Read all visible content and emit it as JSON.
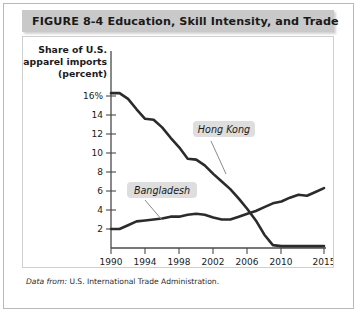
{
  "figure": {
    "number_label": "FIGURE  8-4",
    "title": "Education, Skill Intensity, and Trade",
    "full_title": "FIGURE  8-4   Education, Skill Intensity, and Trade",
    "source_lead": "Data from:",
    "source_text": "U.S. International Trade Administration.",
    "colors": {
      "title_bar": "#c9c9c9",
      "line": "#2b2b2b",
      "label_chip": "#dedede",
      "frame": "#b8b8b8",
      "card_border": "#cfcfcf"
    }
  },
  "chart_data": {
    "type": "line",
    "title": "Education, Skill Intensity, and Trade",
    "ylabel": "Share of U.S. apparel imports (percent)",
    "ylabel_lines": [
      "Share of U.S.",
      "apparel imports",
      "(percent)"
    ],
    "xlabel": "Year",
    "xlim": [
      1990,
      2015
    ],
    "ylim": [
      0,
      17
    ],
    "grid": false,
    "legend_position": "inline-annotations",
    "yticks": [
      2,
      4,
      6,
      8,
      10,
      12,
      14,
      16
    ],
    "ytick_labels": [
      "2",
      "4",
      "6",
      "8",
      "10",
      "12",
      "14",
      "16%"
    ],
    "xticks": [
      1990,
      1994,
      1998,
      2002,
      2006,
      2010,
      2015
    ],
    "xtick_labels": [
      "1990",
      "1994",
      "1998",
      "2002",
      "2006",
      "2010",
      "2015"
    ],
    "x": [
      1990,
      1991,
      1992,
      1993,
      1994,
      1995,
      1996,
      1997,
      1998,
      1999,
      2000,
      2001,
      2002,
      2003,
      2004,
      2005,
      2006,
      2007,
      2008,
      2009,
      2010,
      2011,
      2012,
      2013,
      2014,
      2015
    ],
    "series": [
      {
        "name": "Hong Kong",
        "label": "Hong Kong",
        "values": [
          16.3,
          16.3,
          15.7,
          14.6,
          13.6,
          13.5,
          12.7,
          11.6,
          10.6,
          9.4,
          9.3,
          8.7,
          7.8,
          7.0,
          6.2,
          5.2,
          4.1,
          2.9,
          1.4,
          0.3,
          0.2,
          0.2,
          0.2,
          0.2,
          0.2,
          0.2
        ]
      },
      {
        "name": "Bangladesh",
        "label": "Bangladesh",
        "values": [
          2.0,
          2.0,
          2.4,
          2.8,
          2.9,
          3.0,
          3.1,
          3.3,
          3.3,
          3.5,
          3.6,
          3.5,
          3.2,
          3.0,
          3.0,
          3.3,
          3.6,
          3.9,
          4.3,
          4.7,
          4.9,
          5.3,
          5.6,
          5.5,
          5.9,
          6.3
        ]
      }
    ],
    "annotations": [
      {
        "text": "Hong Kong",
        "for_series": "Hong Kong"
      },
      {
        "text": "Bangladesh",
        "for_series": "Bangladesh"
      }
    ]
  }
}
